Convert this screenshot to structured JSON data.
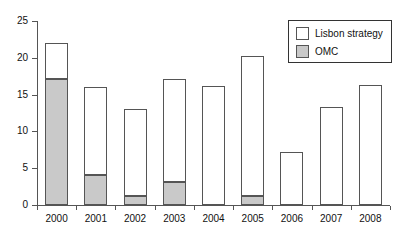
{
  "chart_data": {
    "type": "bar",
    "stacked": true,
    "title": "",
    "subtitle": "",
    "xlabel": "",
    "ylabel": "",
    "categories": [
      "2000",
      "2001",
      "2002",
      "2003",
      "2004",
      "2005",
      "2006",
      "2007",
      "2008"
    ],
    "series": [
      {
        "name": "OMC",
        "color": "#c9c9c9",
        "values": [
          17.1,
          4.1,
          1.2,
          3.1,
          0,
          1.2,
          0,
          0,
          0
        ]
      },
      {
        "name": "Lisbon strategy",
        "color": "#ffffff",
        "values": [
          4.9,
          12.0,
          11.9,
          14.0,
          16.2,
          19.0,
          7.2,
          13.3,
          16.3
        ]
      }
    ],
    "totals": [
      22.0,
      16.1,
      13.1,
      17.1,
      16.2,
      20.2,
      7.2,
      13.3,
      16.3
    ],
    "ylim": [
      0,
      25
    ],
    "yticks": [
      0,
      5,
      10,
      15,
      20,
      25
    ],
    "ytick_labels": [
      "0",
      "5",
      "10",
      "15",
      "20",
      "25"
    ],
    "grid": false,
    "legend_position": "top-right",
    "legend_entries": [
      {
        "label": "Lisbon strategy",
        "swatch": "white"
      },
      {
        "label": "OMC",
        "swatch": "gray"
      }
    ]
  },
  "legend": {
    "items": [
      {
        "label": "Lisbon strategy"
      },
      {
        "label": "OMC"
      }
    ]
  },
  "axes": {
    "y": {
      "labels": [
        "0",
        "5",
        "10",
        "15",
        "20",
        "25"
      ]
    },
    "x": {
      "labels": [
        "2000",
        "2001",
        "2002",
        "2003",
        "2004",
        "2005",
        "2006",
        "2007",
        "2008"
      ]
    }
  },
  "colors": {
    "omc_fill": "#c9c9c9",
    "lisbon_fill": "#ffffff",
    "bar_stroke": "#555555",
    "axis": "#555555",
    "text": "#111111",
    "background": "#ffffff"
  }
}
